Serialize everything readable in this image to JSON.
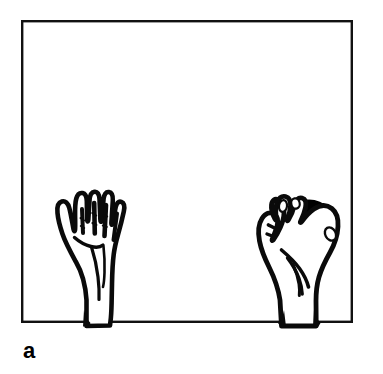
{
  "figure": {
    "panel_label": "a",
    "caption_text": "",
    "background_color": "#ffffff",
    "ink_color": "#000000",
    "frame": {
      "name": "table-surface-frame",
      "x": 22,
      "y": 21,
      "width": 330,
      "height": 301,
      "stroke_width": 2.4,
      "stroke_color": "#111111",
      "fill": "#ffffff"
    },
    "objects": [
      {
        "name": "left-hand-open-empty",
        "description": "open left hand, palm toward viewer, fingers extended upward, thumb at left, wrist crossing bottom frame line",
        "side": "left",
        "holds_object": false,
        "bbox": [
          44,
          188,
          72,
          137
        ]
      },
      {
        "name": "right-hand-holding-ball",
        "description": "right hand grasping a solid black sphere, fingers curled over the ball, wrist crossing bottom frame line",
        "side": "right",
        "holds_object": true,
        "bbox": [
          256,
          188,
          92,
          137
        ]
      },
      {
        "name": "black-ball",
        "description": "solid black sphere held in the right hand",
        "shape": "circle",
        "fill": "#000000",
        "center": [
          309,
          228
        ],
        "radius": 28
      }
    ]
  }
}
